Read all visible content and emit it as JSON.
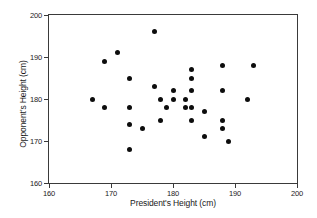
{
  "chart_data": {
    "type": "scatter",
    "title": "",
    "xlabel": "President's Height (cm)",
    "ylabel": "Opponent's Height (cm)",
    "xlim": [
      160,
      200
    ],
    "ylim": [
      160,
      200
    ],
    "xticks": [
      160,
      170,
      180,
      190,
      200
    ],
    "yticks": [
      160,
      170,
      180,
      190,
      200
    ],
    "grid": false,
    "legend": null,
    "marker": "filled-circle",
    "marker_color": "#0d0d0d",
    "points": [
      {
        "x": 167,
        "y": 180
      },
      {
        "x": 169,
        "y": 189
      },
      {
        "x": 169,
        "y": 178
      },
      {
        "x": 171,
        "y": 191
      },
      {
        "x": 173,
        "y": 185
      },
      {
        "x": 173,
        "y": 178
      },
      {
        "x": 173,
        "y": 174
      },
      {
        "x": 173,
        "y": 168
      },
      {
        "x": 175,
        "y": 173
      },
      {
        "x": 177,
        "y": 196
      },
      {
        "x": 177,
        "y": 183
      },
      {
        "x": 178,
        "y": 180
      },
      {
        "x": 178,
        "y": 175
      },
      {
        "x": 179,
        "y": 178
      },
      {
        "x": 180,
        "y": 182
      },
      {
        "x": 180,
        "y": 180
      },
      {
        "x": 182,
        "y": 180
      },
      {
        "x": 182,
        "y": 178
      },
      {
        "x": 183,
        "y": 187
      },
      {
        "x": 183,
        "y": 185
      },
      {
        "x": 183,
        "y": 182
      },
      {
        "x": 183,
        "y": 178
      },
      {
        "x": 183,
        "y": 175
      },
      {
        "x": 185,
        "y": 177
      },
      {
        "x": 185,
        "y": 171
      },
      {
        "x": 188,
        "y": 188
      },
      {
        "x": 188,
        "y": 182
      },
      {
        "x": 188,
        "y": 175
      },
      {
        "x": 188,
        "y": 173
      },
      {
        "x": 189,
        "y": 170
      },
      {
        "x": 192,
        "y": 180
      },
      {
        "x": 193,
        "y": 188
      }
    ]
  }
}
